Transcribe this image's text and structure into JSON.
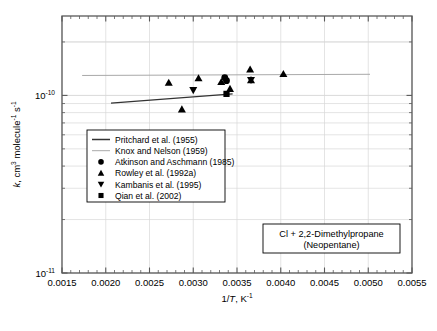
{
  "chart_data": {
    "type": "scatter",
    "title": "",
    "xlabel": "1/T, K-1",
    "xlabel_parts": {
      "pre": "1/",
      "ital": "T",
      "post": ", K",
      "sup": "-1"
    },
    "ylabel": "k, cm3 molecule-1 s-1",
    "ylabel_parts": {
      "ital": "k",
      "p1": ", cm",
      "s1": "3",
      "p2": " molecule",
      "s2": "-1",
      "p3": " s",
      "s3": "-1"
    },
    "xscale": "linear",
    "yscale": "log",
    "xlim": [
      0.0015,
      0.0055
    ],
    "ylim": [
      1e-11,
      2.8e-10
    ],
    "xticks": [
      0.0015,
      0.002,
      0.0025,
      0.003,
      0.0035,
      0.004,
      0.0045,
      0.005,
      0.0055
    ],
    "xticklabels": [
      "0.0015",
      "0.0020",
      "0.0025",
      "0.0030",
      "0.0035",
      "0.0040",
      "0.0045",
      "0.0050",
      "0.0055"
    ],
    "xminor_step": 0.0001,
    "yticks": [
      1e-10,
      1e-11
    ],
    "yticklabels": [
      "10-10",
      "10-11"
    ],
    "yticklabel_parts": [
      {
        "base": "10",
        "exp": "-10"
      },
      {
        "base": "10",
        "exp": "-11"
      }
    ],
    "grid": true,
    "grid_color": "#d9d9d9",
    "frame_color": "#595959",
    "legend_position": "center-left",
    "series": [
      {
        "name": "Pritchard et al. (1955)",
        "type": "line",
        "marker": "line",
        "color": "#333333",
        "linewidth": 1.4,
        "points": [
          {
            "x": 0.00206,
            "y": 9.05e-11
          },
          {
            "x": 0.00345,
            "y": 1.02e-10
          }
        ]
      },
      {
        "name": "Knox and Nelson (1959)",
        "type": "line",
        "marker": "line",
        "color": "#a9a9a9",
        "linewidth": 1.0,
        "points": [
          {
            "x": 0.00173,
            "y": 1.295e-10
          },
          {
            "x": 0.00502,
            "y": 1.315e-10
          }
        ]
      },
      {
        "name": "Atkinson and Aschmann (1985)",
        "type": "scatter",
        "marker": "circle",
        "color": "#000000",
        "points": [
          {
            "x": 0.00336,
            "y": 1.26e-10
          },
          {
            "x": 0.00338,
            "y": 1.21e-10
          }
        ]
      },
      {
        "name": "Rowley et al. (1992a)",
        "type": "scatter",
        "marker": "triangle-up",
        "color": "#000000",
        "points": [
          {
            "x": 0.00272,
            "y": 1.18e-10
          },
          {
            "x": 0.00287,
            "y": 8.35e-11
          },
          {
            "x": 0.00306,
            "y": 1.25e-10
          },
          {
            "x": 0.00332,
            "y": 1.19e-10
          },
          {
            "x": 0.00342,
            "y": 1.09e-10
          },
          {
            "x": 0.00365,
            "y": 1.4e-10
          },
          {
            "x": 0.00366,
            "y": 1.22e-10
          },
          {
            "x": 0.00403,
            "y": 1.32e-10
          }
        ]
      },
      {
        "name": "Kambanis et al. (1995)",
        "type": "scatter",
        "marker": "triangle-down",
        "color": "#000000",
        "points": [
          {
            "x": 0.003,
            "y": 1.07e-10
          },
          {
            "x": 0.00366,
            "y": 1.22e-10
          }
        ]
      },
      {
        "name": "Qian et al. (2002)",
        "type": "scatter",
        "marker": "square",
        "color": "#000000",
        "points": [
          {
            "x": 0.00338,
            "y": 1.02e-10
          }
        ]
      }
    ],
    "legend_entries": [
      {
        "label": "Pritchard et al. (1955)",
        "marker": "line",
        "color": "#333333"
      },
      {
        "label": "Knox and Nelson (1959)",
        "marker": "line",
        "color": "#a9a9a9"
      },
      {
        "label": "Atkinson and Aschmann (1985)",
        "marker": "circle",
        "color": "#000000"
      },
      {
        "label": "Rowley et al. (1992a)",
        "marker": "triangle-up",
        "color": "#000000"
      },
      {
        "label": "Kambanis et al. (1995)",
        "marker": "triangle-down",
        "color": "#000000"
      },
      {
        "label": "Qian et al. (2002)",
        "marker": "square",
        "color": "#000000"
      }
    ],
    "annotations": [
      {
        "name": "reaction-label",
        "line1": "Cl + 2,2-Dimethylpropane",
        "line2": "(Neopentane)"
      }
    ]
  }
}
